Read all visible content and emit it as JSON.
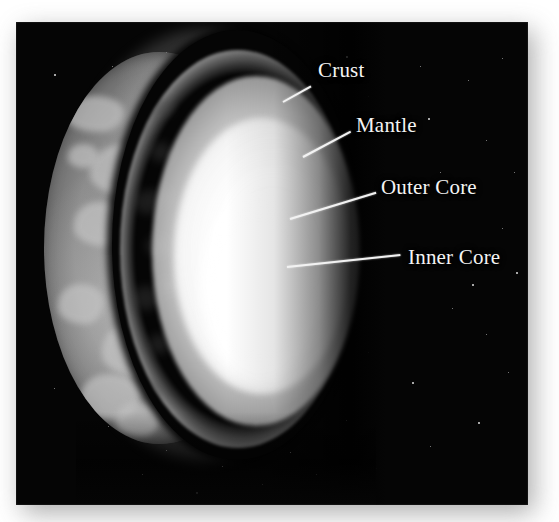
{
  "figure": {
    "background_color": "#ffffff",
    "plate_color": "#050505",
    "label_color": "#f4f4f4",
    "leader_color": "#f2f2f2"
  },
  "callouts": [
    {
      "id": "crust",
      "label": "Crust",
      "label_x": 318,
      "label_y": 60,
      "leader_x": 283,
      "leader_y": 101,
      "leader_length": 32,
      "leader_angle": -29
    },
    {
      "id": "mantle",
      "label": "Mantle",
      "label_x": 356,
      "label_y": 115,
      "leader_x": 303,
      "leader_y": 156,
      "leader_length": 54,
      "leader_angle": -28
    },
    {
      "id": "outer-core",
      "label": "Outer Core",
      "label_x": 381,
      "label_y": 177,
      "leader_x": 290,
      "leader_y": 218,
      "leader_length": 90,
      "leader_angle": -17
    },
    {
      "id": "inner-core",
      "label": "Inner Core",
      "label_x": 408,
      "label_y": 247,
      "leader_x": 287,
      "leader_y": 266,
      "leader_length": 114,
      "leader_angle": -6
    }
  ],
  "layers": [
    {
      "name": "Crust",
      "order": 1,
      "visual": "thin bright outer arc over gray land-and-sea surface crescent"
    },
    {
      "name": "Mantle",
      "order": 2,
      "visual": "thick mottled gray shell"
    },
    {
      "name": "Outer Core",
      "order": 3,
      "visual": "bright white shell"
    },
    {
      "name": "Inner Core",
      "order": 4,
      "visual": "intense white glowing center"
    }
  ],
  "stars": [
    [
      38,
      52
    ],
    [
      96,
      44
    ],
    [
      150,
      30
    ],
    [
      222,
      60
    ],
    [
      268,
      38
    ],
    [
      330,
      34
    ],
    [
      404,
      44
    ],
    [
      452,
      58
    ],
    [
      486,
      36
    ],
    [
      58,
      104
    ],
    [
      412,
      96
    ],
    [
      470,
      118
    ],
    [
      498,
      150
    ],
    [
      42,
      170
    ],
    [
      486,
      206
    ],
    [
      500,
      250
    ],
    [
      60,
      300
    ],
    [
      38,
      366
    ],
    [
      92,
      404
    ],
    [
      126,
      452
    ],
    [
      180,
      470
    ],
    [
      246,
      462
    ],
    [
      300,
      452
    ],
    [
      360,
      446
    ],
    [
      414,
      424
    ],
    [
      462,
      400
    ],
    [
      492,
      350
    ],
    [
      470,
      312
    ],
    [
      436,
      286
    ],
    [
      352,
      330
    ],
    [
      396,
      360
    ],
    [
      330,
      398
    ],
    [
      274,
      430
    ],
    [
      206,
      444
    ],
    [
      150,
      428
    ],
    [
      96,
      372
    ],
    [
      70,
      236
    ],
    [
      52,
      132
    ],
    [
      352,
      74
    ],
    [
      424,
      150
    ],
    [
      456,
      262
    ]
  ],
  "landmasses": [
    [
      22,
      44,
      58,
      36
    ],
    [
      46,
      92,
      74,
      52
    ],
    [
      30,
      150,
      52,
      44
    ],
    [
      68,
      186,
      66,
      50
    ],
    [
      14,
      232,
      46,
      40
    ],
    [
      58,
      268,
      80,
      58
    ],
    [
      36,
      322,
      60,
      46
    ],
    [
      86,
      118,
      40,
      30
    ],
    [
      100,
      236,
      34,
      28
    ],
    [
      24,
      92,
      30,
      24
    ],
    [
      72,
      350,
      44,
      34
    ],
    [
      106,
      300,
      30,
      26
    ]
  ],
  "mantle_mottles": [
    [
      18,
      46,
      26,
      22
    ],
    [
      30,
      92,
      22,
      20
    ],
    [
      14,
      140,
      28,
      24
    ],
    [
      26,
      186,
      24,
      20
    ],
    [
      12,
      236,
      28,
      24
    ],
    [
      28,
      284,
      22,
      20
    ],
    [
      16,
      330,
      26,
      22
    ],
    [
      34,
      138,
      18,
      16
    ],
    [
      40,
      228,
      18,
      16
    ],
    [
      22,
      360,
      20,
      18
    ],
    [
      8,
      66,
      20,
      18
    ],
    [
      36,
      50,
      18,
      16
    ]
  ]
}
